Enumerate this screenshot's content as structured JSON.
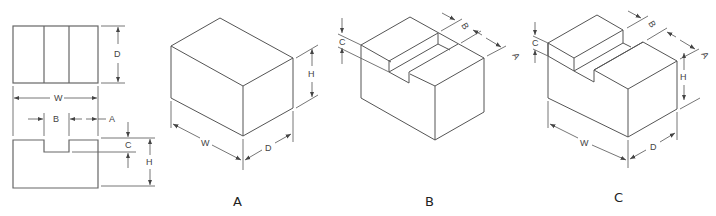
{
  "figure": {
    "orthographic": {
      "labels": {
        "depth": "D",
        "width": "W",
        "slot_offset": "A",
        "slot_width": "B",
        "slot_depth": "C",
        "height": "H"
      }
    },
    "views": [
      {
        "caption": "A",
        "labels": {
          "width": "W",
          "depth": "D",
          "height": "H"
        }
      },
      {
        "caption": "B",
        "labels": {
          "slot_depth": "C",
          "slot_width": "B",
          "slot_offset": "A"
        }
      },
      {
        "caption": "C",
        "labels": {
          "slot_depth": "C",
          "slot_width": "B",
          "slot_offset": "A",
          "height": "H",
          "width": "W",
          "depth": "D"
        }
      }
    ]
  }
}
